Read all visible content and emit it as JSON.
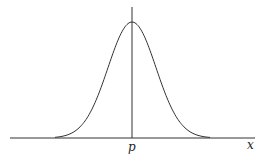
{
  "diagram": {
    "type": "normal-distribution-curve",
    "labels": {
      "center": "p",
      "axis": "x"
    },
    "colors": {
      "line": "#333333",
      "background": "#ffffff"
    }
  }
}
